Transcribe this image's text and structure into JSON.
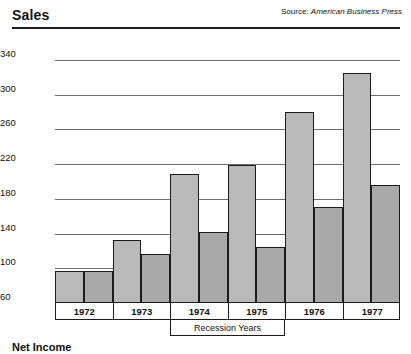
{
  "header": {
    "title": "Sales",
    "source_label": "Source:",
    "source_name": "American Business Press"
  },
  "footer": {
    "title": "Net Income"
  },
  "annotations": {
    "recession_label": "Recession Years",
    "recession_span": [
      "1974",
      "1975"
    ]
  },
  "chart_data": {
    "type": "bar",
    "title": "Sales",
    "xlabel": "",
    "ylabel": "",
    "categories": [
      "1972",
      "1973",
      "1974",
      "1975",
      "1976",
      "1977"
    ],
    "series": [
      {
        "name": "Bar A",
        "values": [
          97,
          133,
          209,
          219,
          280,
          325
        ]
      },
      {
        "name": "Bar B",
        "values": [
          97,
          117,
          142,
          125,
          171,
          196
        ]
      }
    ],
    "ylim": [
      60,
      340
    ],
    "yticks": [
      60,
      100,
      140,
      180,
      220,
      260,
      300,
      340
    ],
    "ytick_labels": [
      "60",
      "100",
      "140",
      "180",
      "220",
      "260",
      "300",
      "340"
    ],
    "grid": true,
    "legend": "none",
    "bar_colors": [
      "#b9b9b9",
      "#a9a9a9"
    ],
    "bar_border_color": "#1b1b1b",
    "annotations": [
      {
        "text": "Recession Years",
        "from": "1974",
        "to": "1975"
      }
    ],
    "source": "Source: American Business Press"
  }
}
